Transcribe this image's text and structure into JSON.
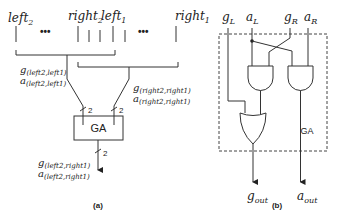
{
  "panel_a": {
    "top_labels": {
      "left2": {
        "base": "left",
        "sub": "2"
      },
      "right2": {
        "base": "right",
        "sub": "2"
      },
      "left1": {
        "base": "left",
        "sub": "1"
      },
      "right1": {
        "base": "right",
        "sub": "1"
      }
    },
    "ellipsis": "•••",
    "left_pair": {
      "g": {
        "base": "g",
        "sub": "(left2,left1)"
      },
      "a": {
        "base": "a",
        "sub": "(left2,left1)"
      }
    },
    "right_pair": {
      "g": {
        "base": "g",
        "sub": "(right2,right1)"
      },
      "a": {
        "base": "a",
        "sub": "(right2,right1)"
      }
    },
    "bus_width": "2",
    "block_label": "GA",
    "output_pair": {
      "g": {
        "base": "g",
        "sub": "(left2,right1)"
      },
      "a": {
        "base": "a",
        "sub": "(left2,right1)"
      }
    },
    "caption": "(a)"
  },
  "panel_b": {
    "inputs": {
      "gL": {
        "base": "g",
        "sub": "L"
      },
      "aL": {
        "base": "a",
        "sub": "L"
      },
      "gR": {
        "base": "g",
        "sub": "R"
      },
      "aR": {
        "base": "a",
        "sub": "R"
      }
    },
    "block_label": "GA",
    "outputs": {
      "gout": {
        "base": "g",
        "sub": "out"
      },
      "aout": {
        "base": "a",
        "sub": "out"
      }
    },
    "caption": "(b)"
  }
}
